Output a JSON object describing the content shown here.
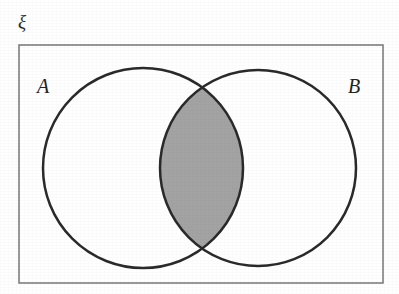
{
  "figure": {
    "kind": "venn-diagram",
    "background_color": "#ffffff"
  },
  "universal_set": {
    "label": "ξ",
    "label_name": "xi",
    "border_color": "#777777",
    "border_width_px": 1.5,
    "fill_color": "#ffffff",
    "rect": {
      "x": 19,
      "y": 45,
      "width": 364,
      "height": 238
    }
  },
  "sets": [
    {
      "id": "A",
      "label": "A",
      "center_x": 143,
      "center_y": 168,
      "radius": 100,
      "stroke_color": "#2a2a2a",
      "stroke_width_px": 2.5,
      "fill_color": "#ffffff",
      "label_x": 37,
      "label_y": 76
    },
    {
      "id": "B",
      "label": "B",
      "center_x": 258,
      "center_y": 168,
      "radius": 98,
      "stroke_color": "#2a2a2a",
      "stroke_width_px": 2.5,
      "fill_color": "#ffffff",
      "label_x": 348,
      "label_y": 76
    }
  ],
  "shaded_region": {
    "name": "A-intersect-B",
    "notation": "A ∩ B",
    "fill_color": "#a3a3a3",
    "stroke_color": "#2a2a2a",
    "crossing_top": {
      "x": 202,
      "y": 93
    },
    "crossing_bottom": {
      "x": 202,
      "y": 243
    }
  }
}
